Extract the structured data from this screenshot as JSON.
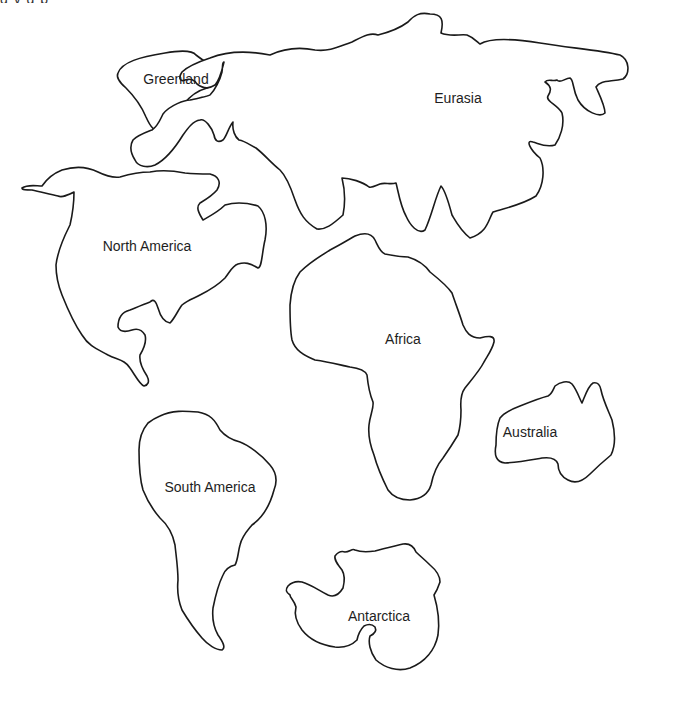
{
  "map": {
    "type": "world continents outline",
    "background": "#ffffff",
    "stroke_color": "#1a1a1a",
    "top_cutoff_text": "g                 y  g                p",
    "continents": [
      {
        "id": "greenland",
        "label": "Greenland",
        "label_x": 176,
        "label_y": 79
      },
      {
        "id": "eurasia",
        "label": "Eurasia",
        "label_x": 458,
        "label_y": 98
      },
      {
        "id": "north-america",
        "label": "North America",
        "label_x": 147,
        "label_y": 246
      },
      {
        "id": "africa",
        "label": "Africa",
        "label_x": 403,
        "label_y": 339
      },
      {
        "id": "australia",
        "label": "Australia",
        "label_x": 530,
        "label_y": 432
      },
      {
        "id": "south-america",
        "label": "South America",
        "label_x": 210,
        "label_y": 487
      },
      {
        "id": "antarctica",
        "label": "Antarctica",
        "label_x": 379,
        "label_y": 616
      }
    ]
  }
}
